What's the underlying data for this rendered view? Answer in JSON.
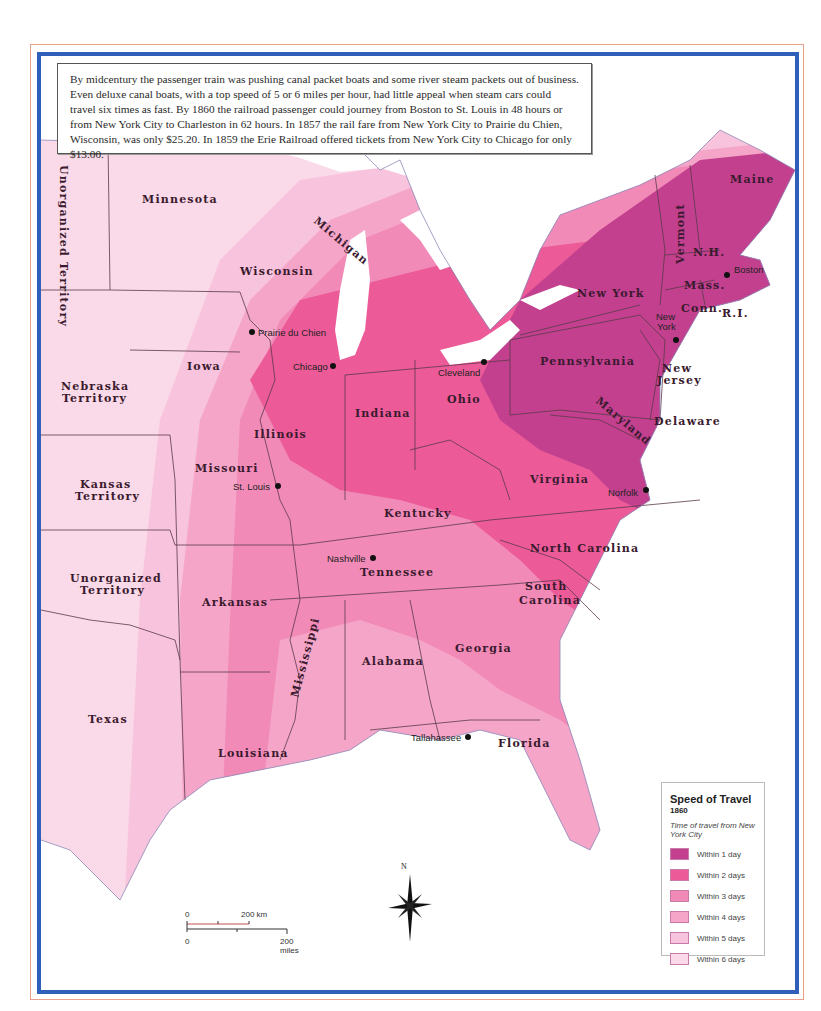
{
  "intro_text": "By midcentury the passenger train was pushing canal packet boats and some river steam packets out of business. Even deluxe canal boats, with a top speed of 5 or 6 miles per hour, had little appeal when steam cars could travel six times as fast. By 1860 the railroad passenger could journey from Boston to St. Louis in 48 hours or from New York City to Charleston in 62 hours. In 1857 the rail fare from New York City to Prairie du Chien, Wisconsin, was only $25.20. In 1859 the Erie Railroad offered tickets from New York City to Chicago for only $13.00.",
  "legend": {
    "title": "Speed of Travel",
    "year": "1860",
    "subtitle": "Time of travel from New York City",
    "items": [
      {
        "label": "Within 1 day",
        "color": "#c2408e"
      },
      {
        "label": "Within 2 days",
        "color": "#ec5a98"
      },
      {
        "label": "Within 3 days",
        "color": "#f28ab8"
      },
      {
        "label": "Within 4 days",
        "color": "#f5a6c8"
      },
      {
        "label": "Within 5 days",
        "color": "#f8c3dc"
      },
      {
        "label": "Within 6 days",
        "color": "#fad9e8"
      }
    ]
  },
  "scale": {
    "km_start": "0",
    "km_end": "200 km",
    "mi_start": "0",
    "mi_end": "200 miles"
  },
  "compass": {
    "north": "N"
  },
  "states": {
    "unorganized_north": "Unorganized Territory",
    "minnesota": "Minnesota",
    "wisconsin": "Wisconsin",
    "michigan": "Michigan",
    "iowa": "Iowa",
    "nebraska_1": "Nebraska",
    "nebraska_2": "Territory",
    "kansas_1": "Kansas",
    "kansas_2": "Territory",
    "unorganized_south_1": "Unorganized",
    "unorganized_south_2": "Territory",
    "texas": "Texas",
    "missouri": "Missouri",
    "illinois": "Illinois",
    "indiana": "Indiana",
    "ohio": "Ohio",
    "kentucky": "Kentucky",
    "tennessee": "Tennessee",
    "arkansas": "Arkansas",
    "louisiana": "Louisiana",
    "mississippi": "Mississippi",
    "alabama": "Alabama",
    "georgia": "Georgia",
    "florida": "Florida",
    "south_carolina_1": "South",
    "south_carolina_2": "Carolina",
    "north_carolina": "North Carolina",
    "virginia": "Virginia",
    "maryland": "Maryland",
    "delaware": "Delaware",
    "new_jersey_1": "New",
    "new_jersey_2": "Jersey",
    "pennsylvania": "Pennsylvania",
    "new_york": "New York",
    "vermont": "Vermont",
    "new_hampshire": "N.H.",
    "maine": "Maine",
    "massachusetts": "Mass.",
    "connecticut": "Conn.",
    "rhode_island": "R.I."
  },
  "cities": {
    "prairie_du_chien": "Prairie du Chien",
    "chicago": "Chicago",
    "cleveland": "Cleveland",
    "st_louis": "St. Louis",
    "nashville": "Nashville",
    "tallahassee": "Tallahassee",
    "norfolk": "Norfolk",
    "boston": "Boston",
    "new_york_1": "New",
    "new_york_2": "York"
  }
}
